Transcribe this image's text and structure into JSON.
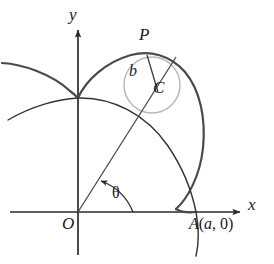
{
  "figure": {
    "kind": "geometry-diagram",
    "background_color": "#ffffff"
  },
  "axes": {
    "x_label": "x",
    "y_label": "y",
    "origin_label": "O",
    "axis_color": "#2b2b2b",
    "origin_px": {
      "x": 78,
      "y": 212
    },
    "x_axis": {
      "x_start": 10,
      "x_end": 242,
      "y": 212
    },
    "y_axis": {
      "x": 78,
      "y_start": 28,
      "y_end": 255
    }
  },
  "points": [
    {
      "name": "P",
      "label": "P",
      "px": {
        "x": 147,
        "y": 53
      }
    },
    {
      "name": "C",
      "label": "C",
      "px": {
        "x": 152,
        "y": 85
      }
    },
    {
      "name": "O",
      "label": "O",
      "px": {
        "x": 78,
        "y": 212
      }
    },
    {
      "name": "A",
      "label": "A(a, 0)",
      "label_parts": {
        "letter": "A",
        "open": "(",
        "a": "a",
        "comma": ", ",
        "zero": "0",
        "close": ")"
      },
      "px": {
        "x": 197,
        "y": 212
      }
    }
  ],
  "segments": [
    {
      "name": "b",
      "label": "b",
      "from": "P",
      "to": "C",
      "color": "#3c3c3c"
    }
  ],
  "angles": [
    {
      "name": "theta",
      "label": "θ",
      "vertex": "O",
      "color": "#2b2b2b"
    }
  ],
  "curves": {
    "main_curve_color": "#4a4a4a",
    "secondary_curve_color": "#333333",
    "circle_color": "#b9b9b9",
    "ray_color": "#4a4a4a"
  },
  "colors": {
    "ink": "#1a1a1a",
    "axis": "#2b2b2b",
    "curve_heavy": "#4a4a4a",
    "curve_light": "#b9b9b9",
    "white": "#ffffff"
  }
}
